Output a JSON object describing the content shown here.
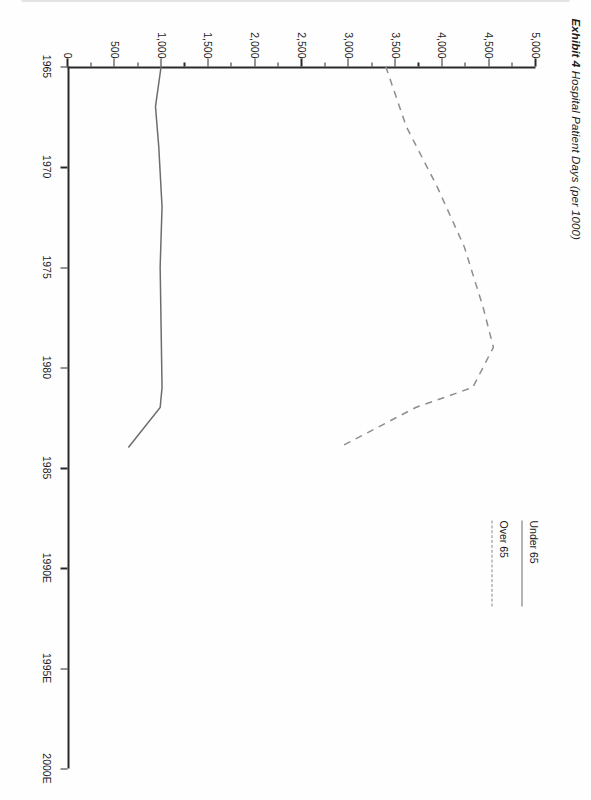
{
  "page": {
    "exhibit_label": "Exhibit 4",
    "title": "Hospital Patient Days (per 1000)"
  },
  "legend": {
    "position": "top-right",
    "items": [
      {
        "label": "Under 65",
        "style": "solid"
      },
      {
        "label": "Over 65",
        "style": "dashed"
      }
    ]
  },
  "axes": {
    "x_ticks": [
      "1965",
      "1970",
      "1975",
      "1980",
      "1985",
      "1990E",
      "1995E",
      "2000E"
    ],
    "y_ticks": [
      "0",
      "500",
      "1,000",
      "1,500",
      "2,000",
      "2,500",
      "3,000",
      "3,500",
      "4,000",
      "4,500",
      "5,000"
    ]
  },
  "chart_data": {
    "type": "line",
    "title": "Hospital Patient Days (per 1000)",
    "xlabel": "",
    "ylabel": "",
    "xlim": [
      1965,
      2000
    ],
    "ylim": [
      0,
      5000
    ],
    "ytick_step": 500,
    "yminor_step": 250,
    "grid": false,
    "legend_position": "top-right",
    "xtick_labels": [
      "1965",
      "1970",
      "1975",
      "1980",
      "1985",
      "1990E",
      "1995E",
      "2000E"
    ],
    "ytick_labels": [
      "0",
      "500",
      "1,000",
      "1,500",
      "2,000",
      "2,500",
      "3,000",
      "3,500",
      "4,000",
      "4,500",
      "5,000"
    ],
    "series": [
      {
        "name": "Under 65",
        "style": "solid",
        "color": "#6d6d6d",
        "x": [
          1965,
          1967,
          1969,
          1972,
          1975,
          1978,
          1981,
          1982,
          1984
        ],
        "values": [
          1000,
          940,
          975,
          1010,
          990,
          1000,
          1010,
          990,
          650
        ]
      },
      {
        "name": "Over 65",
        "style": "dashed",
        "color": "#8e8e8e",
        "x": [
          1965,
          1968,
          1971,
          1974,
          1977,
          1979,
          1981,
          1982,
          1984
        ],
        "values": [
          3400,
          3620,
          3950,
          4240,
          4440,
          4550,
          4330,
          3720,
          2900
        ]
      }
    ]
  }
}
